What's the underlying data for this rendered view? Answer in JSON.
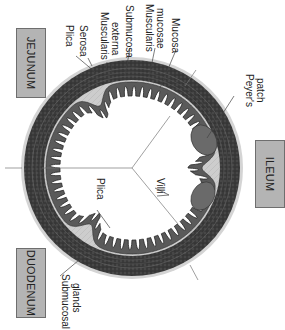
{
  "diagram": {
    "regions": [
      {
        "id": "jejunum",
        "label": "JEJUNUM"
      },
      {
        "id": "ileum",
        "label": "ILEUM"
      },
      {
        "id": "duodenum",
        "label": "DUODENUM"
      }
    ],
    "labels": {
      "plica_top": "Plica",
      "serosa": "Serosa",
      "muscularis_externa_1": "Muscularis",
      "muscularis_externa_2": "externa",
      "submucosa": "Submucosa",
      "muscularis_mucosae_1": "Muscularis",
      "muscularis_mucosae_2": "mucosae",
      "mucosa": "Mucosa",
      "peyers_patch_1": "Peyer's",
      "peyers_patch_2": "patch",
      "villi": "Villi",
      "plica_inner": "Plica",
      "submucosal_glands_1": "Submucosal",
      "submucosal_glands_2": "glands"
    },
    "colors": {
      "serosa": "#d2d2d2",
      "muscularis": "#3a3a3a",
      "submucosa": "#cfcfcf",
      "mucosa": "#5a5a5a",
      "lumen": "#ffffff",
      "region_box": "#b4b4b4"
    }
  }
}
